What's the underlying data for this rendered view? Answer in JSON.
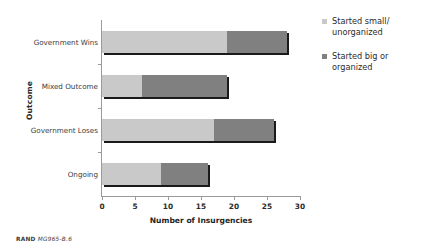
{
  "chart_data": {
    "type": "bar",
    "orientation": "horizontal",
    "stacked": true,
    "title": "",
    "xlabel": "Number of Insurgencies",
    "ylabel": "Outcome",
    "categories": [
      "Government Wins",
      "Mixed Outcome",
      "Government Loses",
      "Ongoing"
    ],
    "series": [
      {
        "name": "Started small/unorganized",
        "color": "#c9c9c9",
        "values": [
          19,
          6,
          17,
          9
        ]
      },
      {
        "name": "Started big or organized",
        "color": "#808080",
        "values": [
          9,
          13,
          9,
          7
        ]
      }
    ],
    "totals": [
      28,
      19,
      26,
      16
    ],
    "xlim": [
      0,
      30
    ],
    "xticks": [
      0,
      5,
      10,
      15,
      20,
      25,
      30
    ],
    "xtick_labels": [
      "0",
      "5",
      "10",
      "15",
      "20",
      "25",
      "30"
    ],
    "grid": false,
    "legend_position": "right"
  },
  "legend": {
    "items": [
      {
        "label_line1": "Started small/",
        "label_line2": "unorganized",
        "color": "#c9c9c9"
      },
      {
        "label_line1": "Started big or",
        "label_line2": "organized",
        "color": "#808080"
      }
    ]
  },
  "footer": {
    "source_mark": "RAND",
    "figure_id": "MG965-B.6"
  }
}
